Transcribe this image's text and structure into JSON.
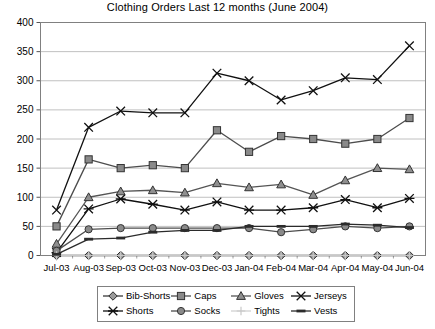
{
  "chart": {
    "title": "Clothing Orders Last 12 months (June 2004)"
  },
  "legend": {
    "items": [
      {
        "label": "Bib-Shorts",
        "marker": "diamond-marker-icon",
        "color": "#3a3a3a"
      },
      {
        "label": "Caps",
        "marker": "square-marker-icon",
        "color": "#4d4d4d"
      },
      {
        "label": "Gloves",
        "marker": "triangle-marker-icon",
        "color": "#555555"
      },
      {
        "label": "Jerseys",
        "marker": "cross-marker-icon",
        "color": "#111111"
      },
      {
        "label": "Shorts",
        "marker": "asterisk-marker-icon",
        "color": "#111111"
      },
      {
        "label": "Socks",
        "marker": "circle-marker-icon",
        "color": "#4d4d4d"
      },
      {
        "label": "Tights",
        "marker": "plus-marker-icon",
        "color": "#c8c8c8"
      },
      {
        "label": "Vests",
        "marker": "dash-marker-icon",
        "color": "#2b2b2b"
      }
    ]
  },
  "chart_data": {
    "type": "line",
    "title": "Clothing Orders Last 12 months (June 2004)",
    "xlabel": "",
    "ylabel": "",
    "ylim": [
      0,
      400
    ],
    "yticks": [
      0,
      50,
      100,
      150,
      200,
      250,
      300,
      350,
      400
    ],
    "grid": true,
    "legend_position": "bottom",
    "categories": [
      "Jul-03",
      "Aug-03",
      "Sep-03",
      "Oct-03",
      "Nov-03",
      "Dec-03",
      "Jan-04",
      "Feb-04",
      "Mar-04",
      "Apr-04",
      "May-04",
      "Jun-04"
    ],
    "series": [
      {
        "name": "Bib-Shorts",
        "marker": "diamond",
        "color": "#3a3a3a",
        "values": [
          0,
          0,
          0,
          0,
          0,
          0,
          0,
          0,
          0,
          0,
          0,
          0
        ]
      },
      {
        "name": "Caps",
        "marker": "square",
        "color": "#4d4d4d",
        "values": [
          50,
          165,
          150,
          155,
          150,
          215,
          178,
          205,
          200,
          192,
          200,
          236
        ]
      },
      {
        "name": "Gloves",
        "marker": "triangle",
        "color": "#555555",
        "values": [
          20,
          100,
          110,
          112,
          108,
          124,
          117,
          122,
          104,
          129,
          150,
          148
        ]
      },
      {
        "name": "Jerseys",
        "marker": "cross",
        "color": "#111111",
        "values": [
          78,
          220,
          248,
          245,
          245,
          313,
          300,
          267,
          283,
          305,
          302,
          360
        ]
      },
      {
        "name": "Shorts",
        "marker": "asterisk",
        "color": "#111111",
        "values": [
          5,
          80,
          97,
          88,
          78,
          92,
          78,
          78,
          82,
          96,
          82,
          98
        ]
      },
      {
        "name": "Socks",
        "marker": "circle",
        "color": "#4d4d4d",
        "values": [
          8,
          45,
          47,
          47,
          47,
          47,
          47,
          40,
          45,
          50,
          47,
          50
        ]
      },
      {
        "name": "Tights",
        "marker": "plus",
        "color": "#c8c8c8",
        "values": [
          0,
          0,
          0,
          0,
          0,
          0,
          0,
          0,
          0,
          0,
          0,
          0
        ]
      },
      {
        "name": "Vests",
        "marker": "dash",
        "color": "#2b2b2b",
        "values": [
          2,
          28,
          30,
          40,
          43,
          43,
          50,
          50,
          50,
          54,
          52,
          48
        ]
      }
    ]
  }
}
